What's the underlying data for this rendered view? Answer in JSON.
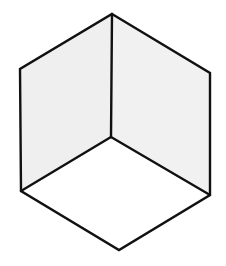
{
  "figure": {
    "type": "isometric-cube-corner",
    "width": 226,
    "height": 266,
    "background": "#ffffff",
    "stroke_color": "#111111",
    "stroke_width": 2.4,
    "vertices": {
      "top": [
        112,
        14
      ],
      "upper_left": [
        20,
        69
      ],
      "upper_right": [
        210,
        73
      ],
      "center": [
        111,
        137
      ],
      "lower_left": [
        21,
        191
      ],
      "lower_right": [
        210,
        195
      ],
      "bottom": [
        119,
        250
      ]
    },
    "faces": [
      {
        "name": "left-wall",
        "fill": "#efefef"
      },
      {
        "name": "right-wall",
        "fill": "#f1f1f1"
      },
      {
        "name": "floor",
        "fill": "#ffffff"
      }
    ]
  }
}
